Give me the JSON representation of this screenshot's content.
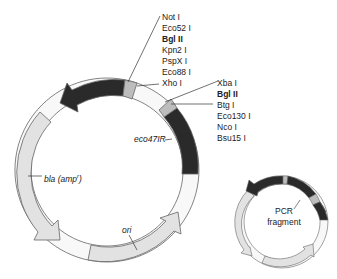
{
  "diagram": {
    "type": "plasmid-map",
    "colors": {
      "dark": "#2a2a2a",
      "mcs": "#bdbdbd",
      "light": "#e2e2e2",
      "white": "#f8f8f8",
      "outline": "#666666"
    },
    "mcs1": {
      "sites": [
        {
          "label": "Not I",
          "bold": false
        },
        {
          "label": "Eco52 I",
          "bold": false
        },
        {
          "label": "Bgl II",
          "bold": true
        },
        {
          "label": "Kpn2 I",
          "bold": false
        },
        {
          "label": "PspX I",
          "bold": false
        },
        {
          "label": "Eco88 I",
          "bold": false
        },
        {
          "label": "Xho I",
          "bold": false
        }
      ]
    },
    "mcs2": {
      "sites": [
        {
          "label": "Xba I",
          "bold": false
        },
        {
          "label": "Bgl II",
          "bold": true
        },
        {
          "label": "Btg I",
          "bold": false
        },
        {
          "label": "Eco130 I",
          "bold": false
        },
        {
          "label": "Nco I",
          "bold": false
        },
        {
          "label": "Bsu15 I",
          "bold": false
        }
      ]
    },
    "features": {
      "eco47IR": "eco47IR",
      "bla": "bla (amp",
      "bla_sup": "r",
      "bla_close": ")",
      "ori": "ori",
      "pcr_line1": "PCR",
      "pcr_line2": "fragment"
    }
  }
}
